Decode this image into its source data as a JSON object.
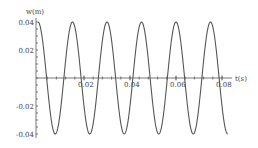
{
  "chart_data": {
    "type": "line",
    "title": "",
    "xlabel": "t(s)",
    "ylabel": "w(m)",
    "xlim": [
      0,
      0.0825
    ],
    "ylim": [
      -0.04,
      0.04
    ],
    "x_ticks": [
      "0.02",
      "0.04",
      "0.06",
      "0.08"
    ],
    "y_ticks": [
      "0.04",
      "0.02",
      "-0.02",
      "-0.04"
    ],
    "grid": false,
    "legend": null,
    "series": [
      {
        "name": "w(t)",
        "function": "0.04*cos(2*pi*t/0.015)",
        "amplitude": 0.04,
        "period": 0.015,
        "color": "#555555"
      }
    ]
  }
}
